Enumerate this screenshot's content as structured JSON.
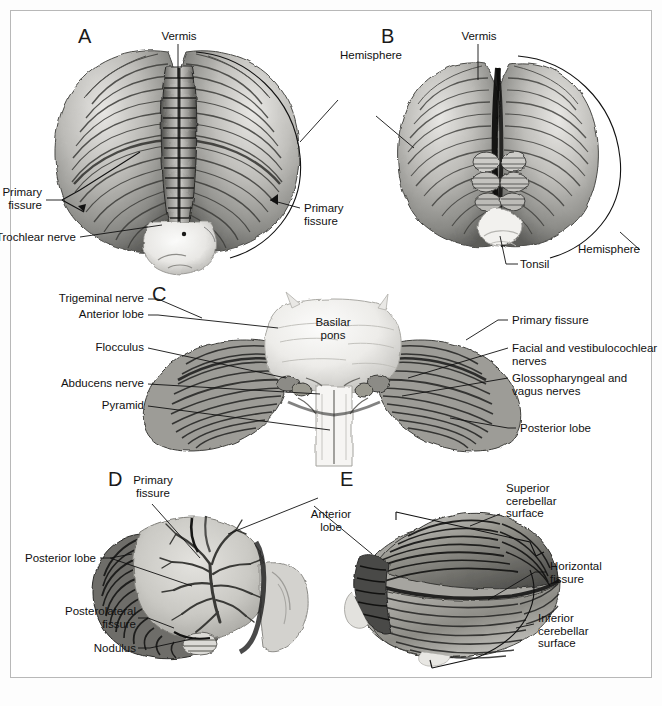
{
  "figure": {
    "background_color": "#ffffff",
    "border_color": "#b8b8b8",
    "label_color": "#111111",
    "panel_letter_color": "#1a1a1a"
  },
  "panels": [
    {
      "letter": "A",
      "view": "superior-view-cerebellum",
      "labels": [
        {
          "name": "vermis",
          "text": "Vermis"
        },
        {
          "name": "hemisphere",
          "text": "Hemisphere"
        },
        {
          "name": "primary-fissure-right",
          "text": "Primary\nfissure"
        },
        {
          "name": "primary-fissure-left",
          "text": "Primary\nfissure"
        },
        {
          "name": "trochlear-nerve",
          "text": "Trochlear nerve"
        }
      ]
    },
    {
      "letter": "B",
      "view": "inferior-view-cerebellum",
      "labels": [
        {
          "name": "vermis",
          "text": "Vermis"
        },
        {
          "name": "hemisphere",
          "text": "Hemisphere"
        },
        {
          "name": "tonsil",
          "text": "Tonsil"
        }
      ]
    },
    {
      "letter": "C",
      "view": "anterior-view-cerebellum-brainstem",
      "labels": [
        {
          "name": "trigeminal-nerve",
          "text": "Trigeminal nerve"
        },
        {
          "name": "anterior-lobe",
          "text": "Anterior lobe"
        },
        {
          "name": "flocculus",
          "text": "Flocculus"
        },
        {
          "name": "abducens-nerve",
          "text": "Abducens nerve"
        },
        {
          "name": "pyramid",
          "text": "Pyramid"
        },
        {
          "name": "basilar-pons",
          "text": "Basilar\npons"
        },
        {
          "name": "primary-fissure",
          "text": "Primary fissure"
        },
        {
          "name": "facial-vestibulocochlear-nerves",
          "text": "Facial and vestibulocochlear\nnerves"
        },
        {
          "name": "glossopharyngeal-vagus-nerves",
          "text": "Glossopharyngeal and\nvagus nerves"
        },
        {
          "name": "posterior-lobe",
          "text": "Posterior lobe"
        }
      ]
    },
    {
      "letter": "D",
      "view": "midsagittal-section-cerebellum",
      "labels": [
        {
          "name": "primary-fissure",
          "text": "Primary\nfissure"
        },
        {
          "name": "posterior-lobe",
          "text": "Posterior lobe"
        },
        {
          "name": "posterolateral-fissure",
          "text": "Posterolateral\nfissure"
        },
        {
          "name": "nodulus",
          "text": "Nodulus"
        },
        {
          "name": "anterior-lobe",
          "text": "Anterior\nlobe"
        }
      ]
    },
    {
      "letter": "E",
      "view": "lateral-view-cerebellum",
      "labels": [
        {
          "name": "superior-cerebellar-surface",
          "text": "Superior\ncerebellar\nsurface"
        },
        {
          "name": "horizontal-fissure",
          "text": "Horizontal\nfissure"
        },
        {
          "name": "inferior-cerebellar-surface",
          "text": "Inferior\ncerebellar\nsurface"
        }
      ]
    }
  ],
  "shared_labels": [
    {
      "name": "anterior-lobe-shared",
      "text": "Anterior\nlobe",
      "applies_to": [
        "D",
        "E"
      ]
    }
  ]
}
